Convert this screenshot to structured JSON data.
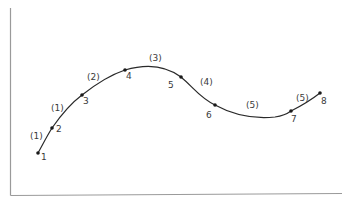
{
  "diagram": {
    "colors": {
      "axis": "#9a9a9a",
      "curve": "#2a2a2a",
      "point": "#1a1a1a",
      "text": "#3a3a3a"
    },
    "points": [
      {
        "label": "1",
        "x": 38,
        "y": 153
      },
      {
        "label": "2",
        "x": 52,
        "y": 128
      },
      {
        "label": "3",
        "x": 82,
        "y": 95
      },
      {
        "label": "4",
        "x": 125,
        "y": 70
      },
      {
        "label": "5",
        "x": 181,
        "y": 77
      },
      {
        "label": "6",
        "x": 215,
        "y": 105
      },
      {
        "label": "7",
        "x": 291,
        "y": 111
      },
      {
        "label": "8",
        "x": 320,
        "y": 93
      }
    ],
    "segments": [
      {
        "label": "(1)",
        "between": "1-2"
      },
      {
        "label": "(1)",
        "between": "2-3"
      },
      {
        "label": "(2)",
        "between": "3-4"
      },
      {
        "label": "(3)",
        "between": "4-5"
      },
      {
        "label": "(4)",
        "between": "5-6"
      },
      {
        "label": "(5)",
        "between": "6-7"
      },
      {
        "label": "(5)",
        "between": "7-8"
      }
    ]
  }
}
